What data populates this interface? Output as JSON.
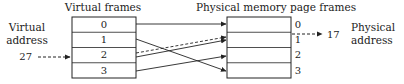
{
  "labels": {
    "virtual_frames_title": "Virtual frames",
    "physical_frames_title": "Physical memory page frames",
    "virtual_address_line1": "Virtual",
    "virtual_address_line2": "address",
    "physical_address_line1": "Physical",
    "physical_address_line2": "address"
  },
  "virtual_address_value": "27",
  "physical_address_value": "17",
  "virtual_frames": [
    "0",
    "1",
    "2",
    "3"
  ],
  "physical_frames": [
    "0",
    "1",
    "2",
    "3"
  ],
  "mappings": [
    {
      "from_virtual": 0,
      "to_physical": 0,
      "style": "solid"
    },
    {
      "from_virtual": 1,
      "to_physical": 3,
      "style": "solid"
    },
    {
      "from_virtual": 2,
      "to_physical": 1,
      "style": "solid"
    },
    {
      "from_virtual": 2,
      "to_physical": 1,
      "style": "dashed"
    },
    {
      "from_virtual": 3,
      "to_physical": 2,
      "style": "solid"
    }
  ],
  "colors": {
    "line": "#222222",
    "text": "#222222",
    "background": "#ffffff"
  }
}
